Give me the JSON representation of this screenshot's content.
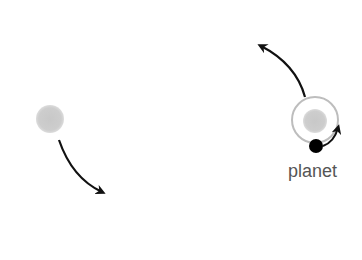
{
  "diagram": {
    "title": "",
    "labels": {
      "planet": "planet"
    },
    "elements": {
      "left_star": {
        "kind": "star",
        "color": "#c8c8c8",
        "motion": "moving-down-right"
      },
      "right_star": {
        "kind": "star",
        "color": "#c8c8c8",
        "motion": "moving-up-left"
      },
      "orbit": {
        "kind": "orbit-ring",
        "color": "#bdbdbd"
      },
      "planet": {
        "kind": "planet",
        "color": "#000000",
        "motion": "counter-clockwise"
      }
    },
    "arrow_color": "#111111"
  }
}
